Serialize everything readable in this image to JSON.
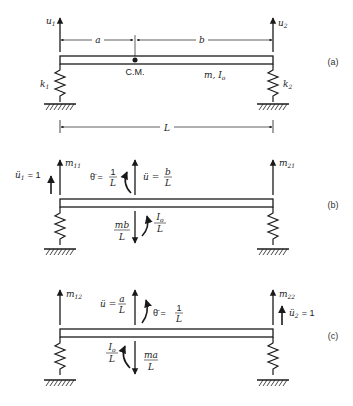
{
  "figure": {
    "colors": {
      "ink": "#1a1a1a",
      "background": "#ffffff"
    }
  },
  "panel_a": {
    "tag": "(a)",
    "u1": "u",
    "u1_sub": "1",
    "u2": "u",
    "u2_sub": "2",
    "dim_a": "a",
    "dim_b": "b",
    "cm": "C.M.",
    "mass": "m, I",
    "mass_sub": "o",
    "k1": "k",
    "k1_sub": "1",
    "k2": "k",
    "k2_sub": "2",
    "length": "L"
  },
  "panel_b": {
    "tag": "(b)",
    "accel_left": "ü",
    "accel_left_sub": "1",
    "accel_left_val": "= 1",
    "m11": "m",
    "m11_sub": "11",
    "theta": "θ̈ =",
    "theta_num": "1",
    "theta_den": "L",
    "u_acc": "ü =",
    "u_num": "b",
    "u_den": "L",
    "m21": "m",
    "m21_sub": "21",
    "force_num": "mb",
    "force_den": "L",
    "moment_num": "I",
    "moment_num_sub": "o",
    "moment_den": "L"
  },
  "panel_c": {
    "tag": "(c)",
    "m12": "m",
    "m12_sub": "12",
    "u_acc": "ü =",
    "u_num": "a",
    "u_den": "L",
    "theta": "θ̈ =",
    "theta_num": "1",
    "theta_den": "L",
    "m22": "m",
    "m22_sub": "22",
    "accel_right": "ü",
    "accel_right_sub": "2",
    "accel_right_val": "= 1",
    "moment_num": "I",
    "moment_num_sub": "o",
    "moment_den": "L",
    "force_num": "ma",
    "force_den": "L"
  }
}
